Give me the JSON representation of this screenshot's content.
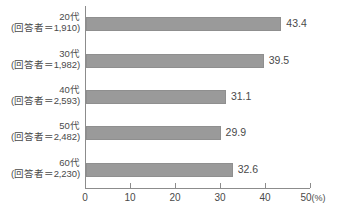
{
  "chart_data": {
    "type": "bar",
    "orientation": "horizontal",
    "title": "",
    "xlabel": "(%)",
    "ylabel": "",
    "categories": [
      "20代",
      "30代",
      "40代",
      "50代",
      "60代"
    ],
    "category_sublabels": [
      "(回答者＝1,910)",
      "(回答者＝1,982)",
      "(回答者＝2,593)",
      "(回答者＝2,482)",
      "(回答者＝2,230)"
    ],
    "respondents": [
      1910,
      1982,
      2593,
      2482,
      2230
    ],
    "values": [
      43.4,
      39.5,
      31.1,
      29.9,
      32.6
    ],
    "value_labels": [
      "43.4",
      "39.5",
      "31.1",
      "29.9",
      "32.6"
    ],
    "xlim": [
      0,
      50
    ],
    "xticks": [
      0,
      10,
      20,
      30,
      40,
      50
    ],
    "xtick_labels": [
      "0",
      "10",
      "20",
      "30",
      "40",
      "50"
    ],
    "unit_label": "(%)",
    "grid": false,
    "legend": false,
    "bar_color": "#9a9a9a",
    "bar_edge_color": "#8f8f8f",
    "axis_color": "#8c8c8c",
    "text_color": "#4a4a4a",
    "background_color": "#ffffff"
  }
}
